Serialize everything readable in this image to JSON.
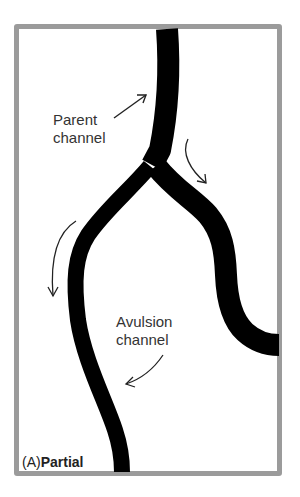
{
  "figure": {
    "panel_letter": "(A)",
    "panel_title": "Partial",
    "labels": {
      "parent_line1": "Parent",
      "parent_line2": "channel",
      "avulsion_line1": "Avulsion",
      "avulsion_line2": "channel"
    },
    "colors": {
      "frame": "#9b9b9b",
      "channel": "#000000",
      "text": "#333333",
      "arrow": "#222222"
    },
    "icons": [
      "parent-channel-arrow-icon",
      "flow-arrow-right-icon",
      "flow-arrow-left-icon",
      "avulsion-channel-arrow-icon"
    ]
  }
}
